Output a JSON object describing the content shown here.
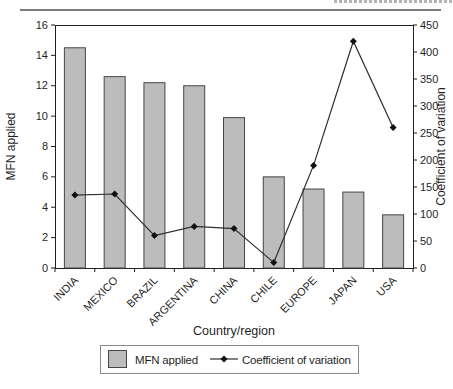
{
  "figure": {
    "background": "#ffffff",
    "top_rule_color": "#7d7d7d"
  },
  "chart_data": {
    "type": "combo-bar-line",
    "categories": [
      "INDIA",
      "MEXICO",
      "BRAZIL",
      "ARGENTINA",
      "CHINA",
      "CHILE",
      "EUROPE",
      "JAPAN",
      "USA"
    ],
    "series": [
      {
        "name": "MFN applied",
        "type": "bar",
        "axis": "left",
        "values": [
          14.5,
          12.6,
          12.2,
          12.0,
          9.9,
          6.0,
          5.2,
          5.0,
          3.5
        ]
      },
      {
        "name": "Coefficient of variation",
        "type": "line",
        "axis": "right",
        "values": [
          135,
          137,
          60,
          77,
          73,
          10,
          190,
          420,
          260
        ]
      }
    ],
    "xlabel": "Country/region",
    "ylabel_left": "MFN applied",
    "ylabel_right": "Coefficient of variation",
    "axis_left": {
      "min": 0,
      "max": 16,
      "ticks": [
        0,
        2,
        4,
        6,
        8,
        10,
        12,
        14,
        16
      ]
    },
    "axis_right": {
      "min": 0,
      "max": 450,
      "ticks": [
        0,
        50,
        100,
        150,
        200,
        250,
        300,
        350,
        400,
        450
      ]
    },
    "grid": false,
    "legend": {
      "position": "bottom",
      "entries": [
        "MFN applied",
        "Coefficient of variation"
      ]
    },
    "colors": {
      "bar_fill": "#bcbcbc",
      "bar_stroke": "#454545",
      "line": "#2e2e2e",
      "marker": "#111111",
      "axis": "#1f1f1f",
      "text": "#1f1f1f",
      "legend_border": "#8a8a8a"
    }
  }
}
